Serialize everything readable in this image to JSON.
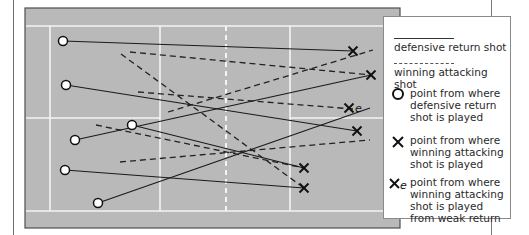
{
  "diagram": {
    "type": "badminton court shot diagram",
    "colors": {
      "court_fill": "#b8b8b8",
      "court_lines": "#f2f2f2",
      "court_border": "#555555",
      "shot_line": "#1a1a1a",
      "marker_fill": "#ffffff"
    },
    "court": {
      "x": 25,
      "y": 8,
      "width": 375,
      "height": 107
    },
    "defensive_return_shots": [
      {
        "from": [
          63,
          41
        ],
        "to": [
          353,
          51
        ]
      },
      {
        "from": [
          66,
          85
        ],
        "to": [
          357,
          131
        ]
      },
      {
        "from": [
          75,
          140
        ],
        "to": [
          371,
          75
        ]
      },
      {
        "from": [
          132,
          125
        ],
        "to": [
          304,
          168
        ]
      },
      {
        "from": [
          65,
          170
        ],
        "to": [
          304,
          188
        ]
      },
      {
        "from": [
          98,
          203
        ],
        "to": [
          370,
          108
        ]
      }
    ],
    "winning_attacking_shots": [
      {
        "from": [
          130,
          52
        ],
        "to": [
          371,
          75
        ]
      },
      {
        "from": [
          121,
          54
        ],
        "to": [
          304,
          188
        ]
      },
      {
        "from": [
          138,
          92
        ],
        "to": [
          353,
          109
        ]
      },
      {
        "from": [
          96,
          125
        ],
        "to": [
          304,
          168
        ]
      },
      {
        "from": [
          120,
          162
        ],
        "to": [
          370,
          140
        ]
      },
      {
        "from": [
          168,
          112
        ],
        "to": [
          373,
          50
        ]
      }
    ],
    "return_points": [
      [
        63,
        41
      ],
      [
        66,
        85
      ],
      [
        75,
        140
      ],
      [
        132,
        125
      ],
      [
        65,
        170
      ],
      [
        98,
        203
      ]
    ],
    "attack_points": [
      [
        353,
        51
      ],
      [
        371,
        75
      ],
      [
        357,
        131
      ],
      [
        304,
        168
      ],
      [
        304,
        188
      ]
    ],
    "weak_return_attack_points": [
      [
        349,
        108
      ]
    ]
  },
  "legend": {
    "items": [
      {
        "symbol": "solid-line",
        "label": "defensive return shot"
      },
      {
        "symbol": "dashed-line",
        "label": "winning attacking shot"
      },
      {
        "symbol": "circle",
        "label": "point from where\ndefensive return\nshot is played"
      },
      {
        "symbol": "cross",
        "label": "point from where\nwinning attacking\nshot is played"
      },
      {
        "symbol": "cross-e",
        "label": "point from where\nwinning attacking\nshot is played\nfrom weak return"
      }
    ],
    "weak_marker_suffix": "e"
  }
}
